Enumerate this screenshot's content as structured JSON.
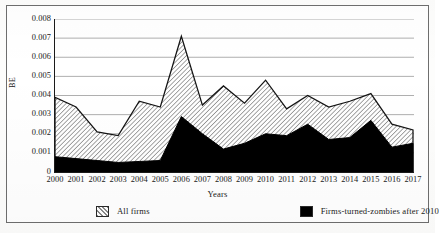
{
  "chart_data": {
    "type": "area",
    "title": "",
    "xlabel": "Years",
    "ylabel": "BE",
    "categories": [
      "2000",
      "2001",
      "2002",
      "2003",
      "2004",
      "2005",
      "2006",
      "2007",
      "2008",
      "2009",
      "2010",
      "2011",
      "2012",
      "2013",
      "2014",
      "2015",
      "2016",
      "2017"
    ],
    "ylim": [
      0,
      0.008
    ],
    "yticks": [
      "0",
      "0.001",
      "0.002",
      "0.003",
      "0.004",
      "0.005",
      "0.006",
      "0.007",
      "0.008"
    ],
    "ytick_values": [
      0,
      0.001,
      0.002,
      0.003,
      0.004,
      0.005,
      0.006,
      0.007,
      0.008
    ],
    "grid": true,
    "legend_position": "bottom",
    "series": [
      {
        "name": "All firms",
        "fill": "hatch-diagonal",
        "color": "#d8d8d8",
        "values": [
          0.0039,
          0.0034,
          0.0021,
          0.0019,
          0.0037,
          0.0034,
          0.0071,
          0.0035,
          0.0045,
          0.0036,
          0.0048,
          0.0033,
          0.004,
          0.0034,
          0.0037,
          0.0041,
          0.0025,
          0.0022
        ]
      },
      {
        "name": "Firms-turned-zombies after 2010",
        "fill": "solid",
        "color": "#000000",
        "values": [
          0.0008,
          0.0007,
          0.0006,
          0.0005,
          0.00055,
          0.0006,
          0.0029,
          0.002,
          0.0012,
          0.0015,
          0.002,
          0.0019,
          0.0025,
          0.0017,
          0.0018,
          0.0027,
          0.0013,
          0.0015
        ]
      }
    ]
  },
  "axes": {
    "y_title": "BE",
    "x_title": "Years"
  },
  "legend": {
    "items": [
      {
        "label": "All firms"
      },
      {
        "label": "Firms-turned-zombies after 2010"
      }
    ]
  }
}
